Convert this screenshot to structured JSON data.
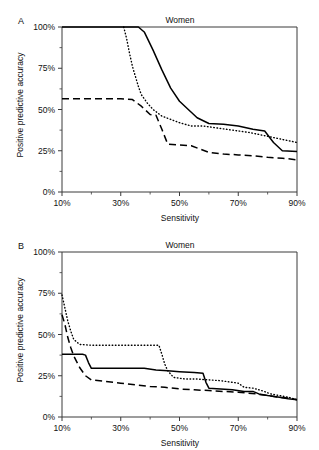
{
  "figure": {
    "width": 319,
    "height": 450,
    "background": "#ffffff",
    "ink_color": "#000000"
  },
  "panels": [
    {
      "letter": "A",
      "title": "Women",
      "xlabel": "Sensitivity",
      "ylabel": "Positive predictive accuracy"
    },
    {
      "letter": "B",
      "title": "Women",
      "xlabel": "Sensitivity",
      "ylabel": "Positive predictive accuracy"
    }
  ],
  "axis": {
    "x_ticks": [
      "10%",
      "30%",
      "50%",
      "70%",
      "90%"
    ],
    "x_tick_values": [
      10,
      30,
      50,
      70,
      90
    ],
    "x_minor_values": [
      20,
      40,
      60,
      80
    ],
    "y_ticks": [
      "0%",
      "25%",
      "50%",
      "75%",
      "100%"
    ],
    "y_tick_values": [
      0,
      25,
      50,
      75,
      100
    ],
    "y_minor_values": [
      12.5,
      37.5,
      62.5,
      87.5
    ],
    "xlim": [
      10,
      90
    ],
    "ylim": [
      0,
      100
    ],
    "grid": false,
    "legend": "none"
  },
  "chart_data": [
    {
      "type": "line",
      "panel": "A",
      "title": "Women",
      "xlabel": "Sensitivity",
      "ylabel": "Positive predictive accuracy",
      "xlim": [
        10,
        90
      ],
      "ylim": [
        0,
        100
      ],
      "x_unit": "%",
      "y_unit": "%",
      "grid": false,
      "legend": "none",
      "series": [
        {
          "name": "solid",
          "style": "solid",
          "points": [
            [
              10,
              100
            ],
            [
              20,
              100
            ],
            [
              30,
              100
            ],
            [
              36,
              100
            ],
            [
              38,
              97
            ],
            [
              41,
              86
            ],
            [
              44,
              74
            ],
            [
              47,
              63
            ],
            [
              50,
              55
            ],
            [
              53,
              50
            ],
            [
              56,
              45
            ],
            [
              60,
              41.5
            ],
            [
              65,
              41
            ],
            [
              70,
              40
            ],
            [
              75,
              38
            ],
            [
              79,
              37
            ],
            [
              82,
              30
            ],
            [
              85,
              25
            ],
            [
              90,
              24.5
            ]
          ]
        },
        {
          "name": "dotted",
          "style": "dotted",
          "points": [
            [
              31,
              100
            ],
            [
              32,
              93
            ],
            [
              33,
              84
            ],
            [
              34,
              76
            ],
            [
              35,
              70
            ],
            [
              36,
              64
            ],
            [
              37,
              59
            ],
            [
              39,
              54
            ],
            [
              41,
              50
            ],
            [
              44,
              46
            ],
            [
              47,
              44
            ],
            [
              50,
              42
            ],
            [
              54,
              40
            ],
            [
              58,
              40
            ],
            [
              62,
              39
            ],
            [
              66,
              38
            ],
            [
              70,
              37
            ],
            [
              74,
              36
            ],
            [
              78,
              34.5
            ],
            [
              82,
              33
            ],
            [
              86,
              31.5
            ],
            [
              90,
              30
            ]
          ]
        },
        {
          "name": "dashed",
          "style": "dashed",
          "points": [
            [
              10,
              56.5
            ],
            [
              20,
              56.5
            ],
            [
              30,
              56.5
            ],
            [
              34,
              56
            ],
            [
              37,
              52
            ],
            [
              40,
              47
            ],
            [
              42,
              46.5
            ],
            [
              44,
              38
            ],
            [
              46,
              29
            ],
            [
              50,
              28.5
            ],
            [
              54,
              28
            ],
            [
              57,
              26
            ],
            [
              60,
              24
            ],
            [
              65,
              23
            ],
            [
              70,
              22.5
            ],
            [
              75,
              22
            ],
            [
              80,
              21
            ],
            [
              85,
              20.5
            ],
            [
              90,
              19.5
            ]
          ]
        }
      ]
    },
    {
      "type": "line",
      "panel": "B",
      "title": "Women",
      "xlabel": "Sensitivity",
      "ylabel": "Positive predictive accuracy",
      "xlim": [
        10,
        90
      ],
      "ylim": [
        0,
        100
      ],
      "x_unit": "%",
      "y_unit": "%",
      "grid": false,
      "legend": "none",
      "series": [
        {
          "name": "solid",
          "style": "solid",
          "points": [
            [
              10,
              38
            ],
            [
              14,
              38
            ],
            [
              17,
              38
            ],
            [
              18,
              37.5
            ],
            [
              19,
              33
            ],
            [
              20,
              29.5
            ],
            [
              25,
              29.5
            ],
            [
              30,
              29.5
            ],
            [
              35,
              29.5
            ],
            [
              38,
              29.5
            ],
            [
              42,
              28.5
            ],
            [
              46,
              28
            ],
            [
              50,
              27.5
            ],
            [
              55,
              27
            ],
            [
              58,
              26.5
            ],
            [
              59,
              21
            ],
            [
              60,
              17.5
            ],
            [
              64,
              17
            ],
            [
              68,
              16.5
            ],
            [
              72,
              15.5
            ],
            [
              75,
              15.5
            ],
            [
              77,
              14
            ],
            [
              80,
              13
            ],
            [
              84,
              12
            ],
            [
              87,
              11
            ],
            [
              90,
              10.5
            ]
          ]
        },
        {
          "name": "dotted",
          "style": "dotted",
          "points": [
            [
              10,
              74
            ],
            [
              11,
              66
            ],
            [
              12,
              58
            ],
            [
              13,
              52
            ],
            [
              14,
              47
            ],
            [
              16,
              44
            ],
            [
              20,
              43.5
            ],
            [
              25,
              43.5
            ],
            [
              30,
              43.5
            ],
            [
              35,
              43.5
            ],
            [
              40,
              43.5
            ],
            [
              43,
              43.5
            ],
            [
              44,
              38
            ],
            [
              45,
              32
            ],
            [
              46,
              28
            ],
            [
              48,
              24
            ],
            [
              52,
              23
            ],
            [
              56,
              23
            ],
            [
              60,
              22.5
            ],
            [
              64,
              22
            ],
            [
              68,
              21
            ],
            [
              70,
              20.5
            ],
            [
              72,
              18
            ],
            [
              75,
              17.5
            ],
            [
              78,
              16
            ],
            [
              81,
              14
            ],
            [
              84,
              13
            ],
            [
              87,
              12
            ],
            [
              90,
              10.5
            ]
          ]
        },
        {
          "name": "dashed",
          "style": "dashed",
          "points": [
            [
              10,
              62
            ],
            [
              11,
              56
            ],
            [
              12,
              48
            ],
            [
              13,
              42
            ],
            [
              14,
              37
            ],
            [
              16,
              30
            ],
            [
              18,
              25
            ],
            [
              20,
              22.5
            ],
            [
              25,
              21.5
            ],
            [
              30,
              20.5
            ],
            [
              35,
              19.5
            ],
            [
              40,
              18.5
            ],
            [
              45,
              18
            ],
            [
              50,
              17
            ],
            [
              55,
              16.5
            ],
            [
              60,
              16
            ],
            [
              65,
              15.5
            ],
            [
              70,
              15
            ],
            [
              73,
              14.5
            ],
            [
              76,
              14
            ],
            [
              80,
              13
            ],
            [
              84,
              12
            ],
            [
              87,
              11.5
            ],
            [
              90,
              10.5
            ]
          ]
        }
      ]
    }
  ]
}
